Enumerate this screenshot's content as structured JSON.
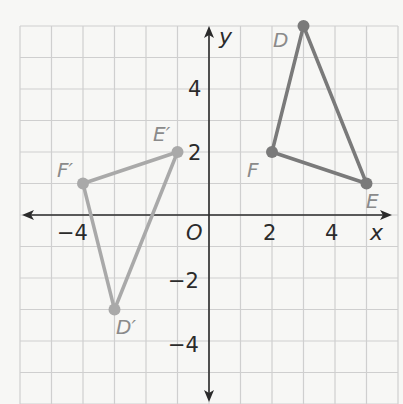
{
  "diagram": {
    "type": "coordinate-plane-transformation",
    "axes": {
      "x_label": "x",
      "y_label": "y",
      "origin_label": "O",
      "x_ticks": [
        {
          "value": -4,
          "label": "−4"
        },
        {
          "value": 2,
          "label": "2"
        },
        {
          "value": 4,
          "label": "4"
        }
      ],
      "y_ticks": [
        {
          "value": 4,
          "label": "4"
        },
        {
          "value": 2,
          "label": "2"
        },
        {
          "value": -2,
          "label": "−2"
        },
        {
          "value": -4,
          "label": "−4"
        }
      ],
      "x_range": [
        -6,
        6
      ],
      "y_range": [
        -6,
        6
      ]
    },
    "original_triangle": {
      "name": "DEF",
      "color": "#7a7a7a",
      "vertices": [
        {
          "label": "D",
          "x": 3,
          "y": 6
        },
        {
          "label": "E",
          "x": 5,
          "y": 1
        },
        {
          "label": "F",
          "x": 2,
          "y": 2
        }
      ]
    },
    "image_triangle": {
      "name": "D'E'F'",
      "color": "#a9a9a9",
      "vertices": [
        {
          "label": "D′",
          "x": -3,
          "y": -3
        },
        {
          "label": "E′",
          "x": -1,
          "y": 2
        },
        {
          "label": "F′",
          "x": -4,
          "y": 1
        }
      ]
    },
    "colors": {
      "grid": "#cfcfcf",
      "axis": "#2b2b2b",
      "tick_text": "#2b2b2b",
      "vertex_text": "#8a8a8a"
    }
  }
}
